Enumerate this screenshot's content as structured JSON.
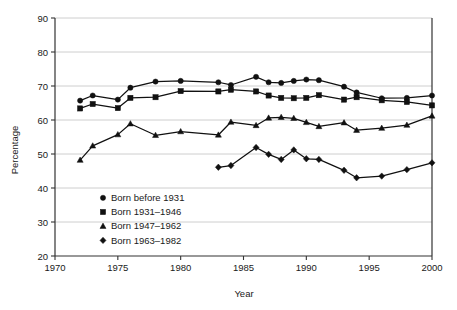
{
  "chart_data": {
    "type": "line",
    "title": "",
    "xlabel": "Year",
    "ylabel": "Percentage",
    "xlim": [
      1970,
      2000
    ],
    "ylim": [
      20,
      90
    ],
    "grid": true,
    "legend_position": "inside-lower-left",
    "xticks": [
      1970,
      1975,
      1980,
      1985,
      1990,
      1995,
      2000
    ],
    "yticks": [
      20,
      30,
      40,
      50,
      60,
      70,
      80,
      90
    ],
    "series": [
      {
        "name": "Born before 1931",
        "marker": "circle",
        "x": [
          1972,
          1973,
          1975,
          1976,
          1978,
          1980,
          1983,
          1984,
          1986,
          1987,
          1988,
          1989,
          1990,
          1991,
          1993,
          1994,
          1996,
          1998,
          2000
        ],
        "values": [
          65.7,
          67.2,
          66.0,
          69.5,
          71.3,
          71.5,
          71.1,
          70.3,
          72.7,
          71.1,
          70.9,
          71.5,
          71.9,
          71.7,
          69.8,
          68.1,
          66.4,
          66.5,
          67.2
        ]
      },
      {
        "name": "Born 1931–1946",
        "marker": "square",
        "x": [
          1972,
          1973,
          1975,
          1976,
          1978,
          1980,
          1983,
          1984,
          1986,
          1987,
          1988,
          1989,
          1990,
          1991,
          1993,
          1994,
          1996,
          1998,
          2000
        ],
        "values": [
          63.4,
          64.7,
          63.5,
          66.5,
          66.7,
          68.5,
          68.4,
          68.9,
          68.4,
          67.2,
          66.5,
          66.4,
          66.5,
          67.3,
          66.0,
          66.7,
          65.8,
          65.3,
          64.3
        ]
      },
      {
        "name": "Born 1947–1962",
        "marker": "triangle",
        "x": [
          1972,
          1973,
          1975,
          1976,
          1978,
          1980,
          1983,
          1984,
          1986,
          1987,
          1988,
          1989,
          1990,
          1991,
          1993,
          1994,
          1996,
          1998,
          2000
        ],
        "values": [
          48.2,
          52.4,
          55.7,
          58.9,
          55.5,
          56.6,
          55.6,
          59.4,
          58.4,
          60.6,
          60.8,
          60.5,
          59.3,
          58.1,
          59.2,
          57.0,
          57.6,
          58.5,
          61.2
        ]
      },
      {
        "name": "Born 1963–1982",
        "marker": "diamond",
        "x": [
          1983,
          1984,
          1986,
          1987,
          1988,
          1989,
          1990,
          1991,
          1993,
          1994,
          1996,
          1998,
          2000
        ],
        "values": [
          46.1,
          46.6,
          51.9,
          49.9,
          48.4,
          51.2,
          48.6,
          48.4,
          45.2,
          43.0,
          43.5,
          45.4,
          47.4
        ]
      }
    ]
  },
  "legend": {
    "items": [
      {
        "label": "Born before 1931",
        "marker": "circle"
      },
      {
        "label": "Born 1931–1946",
        "marker": "square"
      },
      {
        "label": "Born 1947–1962",
        "marker": "triangle"
      },
      {
        "label": "Born 1963–1982",
        "marker": "diamond"
      }
    ]
  },
  "colors": {
    "series": "#111111",
    "grid": "#c8c8c8",
    "axis": "#333333",
    "background": "#ffffff"
  }
}
